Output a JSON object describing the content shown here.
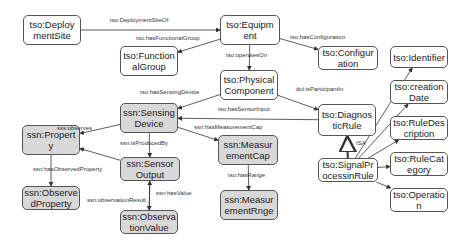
{
  "diagram": {
    "colors": {
      "tso_fill": "#ffffff",
      "ssn_fill": "#d8d8d8",
      "stroke": "#555555",
      "edge": "#333333"
    },
    "nodes": [
      {
        "id": "deploymentSite",
        "label": "tso:Deploy\nmentSite",
        "kind": "tso",
        "x": 23,
        "y": 15,
        "w": 58,
        "h": 30
      },
      {
        "id": "equipment",
        "label": "tso:Equipm\nent",
        "kind": "tso",
        "x": 220,
        "y": 15,
        "w": 60,
        "h": 30
      },
      {
        "id": "functionalGroup",
        "label": "tso:Function\nalGroup",
        "kind": "tso",
        "x": 120,
        "y": 46,
        "w": 58,
        "h": 30
      },
      {
        "id": "configuration",
        "label": "tso:Configur\nation",
        "kind": "tso",
        "x": 318,
        "y": 46,
        "w": 60,
        "h": 24
      },
      {
        "id": "physicalComponent",
        "label": "tso:Physical\nComponent",
        "kind": "tso",
        "x": 220,
        "y": 70,
        "w": 58,
        "h": 30
      },
      {
        "id": "sensingDevice",
        "label": "ssn:Sensing\nDevice",
        "kind": "ssn",
        "x": 120,
        "y": 103,
        "w": 58,
        "h": 30
      },
      {
        "id": "diagnosticRule",
        "label": "tso:Diagnos\nticRule",
        "kind": "tso",
        "x": 318,
        "y": 104,
        "w": 58,
        "h": 32
      },
      {
        "id": "property",
        "label": "ssn:Propert\ny",
        "kind": "ssn",
        "x": 22,
        "y": 125,
        "w": 58,
        "h": 30
      },
      {
        "id": "measurementCap",
        "label": "ssn:Measur\nementCap",
        "kind": "ssn",
        "x": 218,
        "y": 135,
        "w": 60,
        "h": 30
      },
      {
        "id": "sensorOutput",
        "label": "ssn:Sensor\nOutput",
        "kind": "ssn",
        "x": 120,
        "y": 157,
        "w": 60,
        "h": 24
      },
      {
        "id": "signalProcessingRule",
        "label": "tso:SignalPr\nocessinRule",
        "kind": "tso",
        "x": 318,
        "y": 158,
        "w": 60,
        "h": 24
      },
      {
        "id": "observedProperty",
        "label": "ssn:Observe\ndProperty",
        "kind": "ssn",
        "x": 22,
        "y": 186,
        "w": 58,
        "h": 24
      },
      {
        "id": "measurementRange",
        "label": "ssn:Measur\nementRnge",
        "kind": "ssn",
        "x": 220,
        "y": 190,
        "w": 58,
        "h": 30
      },
      {
        "id": "observationValue",
        "label": "ssn:Observa\ntionValue",
        "kind": "ssn",
        "x": 120,
        "y": 210,
        "w": 58,
        "h": 24
      },
      {
        "id": "identifier",
        "label": "tso:Identifier",
        "kind": "tso",
        "x": 390,
        "y": 46,
        "w": 58,
        "h": 22
      },
      {
        "id": "creationDate",
        "label": "tso:creation\nDate",
        "kind": "tso",
        "x": 390,
        "y": 80,
        "w": 58,
        "h": 24
      },
      {
        "id": "ruleDescription",
        "label": "tso:RuleDes\ncription",
        "kind": "tso",
        "x": 390,
        "y": 116,
        "w": 58,
        "h": 24
      },
      {
        "id": "ruleCategory",
        "label": "tso:RuleCat\negory",
        "kind": "tso",
        "x": 390,
        "y": 152,
        "w": 58,
        "h": 24
      },
      {
        "id": "operation",
        "label": "tso:Operatio\nn",
        "kind": "tso",
        "x": 390,
        "y": 188,
        "w": 58,
        "h": 24
      }
    ],
    "edges": [
      {
        "from": "deploymentSite",
        "to": "equipment",
        "label": "tso:DeploymentSiteOf",
        "lx": 110,
        "ly": 17
      },
      {
        "from": "equipment",
        "to": "functionalGroup",
        "label": "tso:hasFunctionalGroup",
        "lx": 136,
        "ly": 35
      },
      {
        "from": "equipment",
        "to": "configuration",
        "label": "tso:hasConfiguration",
        "lx": 290,
        "ly": 34
      },
      {
        "from": "equipment",
        "to": "physicalComponent",
        "label": "tso:operatesOn",
        "lx": 226,
        "ly": 52
      },
      {
        "from": "physicalComponent",
        "to": "sensingDevice",
        "label": "tso:hasSensingDevice",
        "lx": 140,
        "ly": 89
      },
      {
        "from": "physicalComponent",
        "to": "diagnosticRule",
        "label": "dul:isParticipantIn",
        "lx": 296,
        "ly": 86
      },
      {
        "from": "diagnosticRule",
        "to": "sensingDevice",
        "label": "tso:hasSensorInput",
        "lx": 218,
        "ly": 106
      },
      {
        "from": "sensingDevice",
        "to": "property",
        "label": "sss:observes",
        "lx": 57,
        "ly": 125
      },
      {
        "from": "sensingDevice",
        "to": "measurementCap",
        "label": "ssn:hasMeasurementCap",
        "lx": 194,
        "ly": 124
      },
      {
        "from": "sensingDevice",
        "to": "sensorOutput",
        "label": "ssn:isProducedBy",
        "lx": 120,
        "ly": 140
      },
      {
        "from": "sensorOutput",
        "to": "property",
        "label": "ssn:hasObservedProperty",
        "lx": 33,
        "ly": 166
      },
      {
        "from": "property",
        "to": "observedProperty",
        "label": "",
        "lx": 0,
        "ly": 0
      },
      {
        "from": "observationValue",
        "to": "sensorOutput",
        "label": "ssn:observationResult",
        "lx": 87,
        "ly": 197
      },
      {
        "from": "sensorOutput",
        "to": "observationValue",
        "label": "ssn:hasValue",
        "lx": 156,
        "ly": 190
      },
      {
        "from": "measurementCap",
        "to": "measurementRange",
        "label": "tso:hasRange",
        "lx": 228,
        "ly": 172
      },
      {
        "from": "signalProcessingRule",
        "to": "diagnosticRule",
        "label": "ISA",
        "lx": 356,
        "ly": 140,
        "isa": true
      },
      {
        "from": "signalProcessingRule",
        "to": "identifier",
        "label": "",
        "lx": 0,
        "ly": 0
      },
      {
        "from": "signalProcessingRule",
        "to": "creationDate",
        "label": "",
        "lx": 0,
        "ly": 0
      },
      {
        "from": "signalProcessingRule",
        "to": "ruleDescription",
        "label": "",
        "lx": 0,
        "ly": 0
      },
      {
        "from": "signalProcessingRule",
        "to": "ruleCategory",
        "label": "",
        "lx": 0,
        "ly": 0
      },
      {
        "from": "signalProcessingRule",
        "to": "operation",
        "label": "",
        "lx": 0,
        "ly": 0
      }
    ]
  }
}
